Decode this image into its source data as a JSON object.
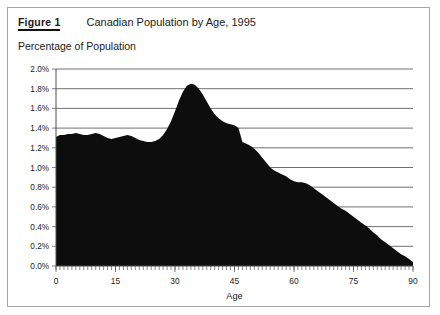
{
  "figure": {
    "label": "Figure 1",
    "title": "Canadian Population by Age, 1995",
    "subtitle": "Percentage of Population"
  },
  "chart_data": {
    "type": "area",
    "title": "Canadian Population by Age, 1995",
    "subtitle": "Percentage of Population",
    "xlabel": "Age",
    "ylabel": "Percentage of Population",
    "xlim": [
      0,
      90
    ],
    "ylim": [
      0,
      2.0
    ],
    "grid": true,
    "legend": "none",
    "fill_color": "#0d0d0d",
    "x_ticks": [
      0,
      15,
      30,
      45,
      60,
      75,
      90
    ],
    "x_tick_labels": [
      "0",
      "15",
      "30",
      "45",
      "60",
      "75",
      "90"
    ],
    "x_minor_tick_step": 1,
    "y_ticks": [
      0.0,
      0.2,
      0.4,
      0.6,
      0.8,
      1.0,
      1.2,
      1.4,
      1.6,
      1.8,
      2.0
    ],
    "y_tick_labels": [
      "0.0%",
      "0.2%",
      "0.4%",
      "0.6%",
      "0.8%",
      "1.0%",
      "1.2%",
      "1.4%",
      "1.6%",
      "1.8%",
      "2.0%"
    ],
    "x": [
      0,
      1,
      2,
      3,
      4,
      5,
      6,
      7,
      8,
      9,
      10,
      11,
      12,
      13,
      14,
      15,
      16,
      17,
      18,
      19,
      20,
      21,
      22,
      23,
      24,
      25,
      26,
      27,
      28,
      29,
      30,
      31,
      32,
      33,
      34,
      35,
      36,
      37,
      38,
      39,
      40,
      41,
      42,
      43,
      44,
      45,
      46,
      47,
      48,
      49,
      50,
      51,
      52,
      53,
      54,
      55,
      56,
      57,
      58,
      59,
      60,
      61,
      62,
      63,
      64,
      65,
      66,
      67,
      68,
      69,
      70,
      71,
      72,
      73,
      74,
      75,
      76,
      77,
      78,
      79,
      80,
      81,
      82,
      83,
      84,
      85,
      86,
      87,
      88,
      89,
      90
    ],
    "values": [
      1.31,
      1.33,
      1.33,
      1.34,
      1.34,
      1.35,
      1.34,
      1.33,
      1.33,
      1.34,
      1.35,
      1.34,
      1.32,
      1.3,
      1.29,
      1.3,
      1.31,
      1.32,
      1.33,
      1.32,
      1.3,
      1.28,
      1.27,
      1.26,
      1.26,
      1.27,
      1.29,
      1.33,
      1.39,
      1.47,
      1.57,
      1.68,
      1.77,
      1.83,
      1.85,
      1.84,
      1.8,
      1.74,
      1.67,
      1.6,
      1.54,
      1.5,
      1.47,
      1.45,
      1.44,
      1.43,
      1.4,
      1.26,
      1.24,
      1.22,
      1.19,
      1.15,
      1.1,
      1.05,
      1.0,
      0.97,
      0.95,
      0.93,
      0.91,
      0.88,
      0.86,
      0.85,
      0.85,
      0.84,
      0.82,
      0.79,
      0.76,
      0.73,
      0.7,
      0.67,
      0.64,
      0.61,
      0.58,
      0.56,
      0.53,
      0.5,
      0.47,
      0.44,
      0.41,
      0.38,
      0.34,
      0.31,
      0.27,
      0.24,
      0.21,
      0.18,
      0.15,
      0.12,
      0.1,
      0.07,
      0.04
    ],
    "series": [
      {
        "name": "Percentage of Population",
        "values": [
          1.31,
          1.33,
          1.33,
          1.34,
          1.34,
          1.35,
          1.34,
          1.33,
          1.33,
          1.34,
          1.35,
          1.34,
          1.32,
          1.3,
          1.29,
          1.3,
          1.31,
          1.32,
          1.33,
          1.32,
          1.3,
          1.28,
          1.27,
          1.26,
          1.26,
          1.27,
          1.29,
          1.33,
          1.39,
          1.47,
          1.57,
          1.68,
          1.77,
          1.83,
          1.85,
          1.84,
          1.8,
          1.74,
          1.67,
          1.6,
          1.54,
          1.5,
          1.47,
          1.45,
          1.44,
          1.43,
          1.4,
          1.26,
          1.24,
          1.22,
          1.19,
          1.15,
          1.1,
          1.05,
          1.0,
          0.97,
          0.95,
          0.93,
          0.91,
          0.88,
          0.86,
          0.85,
          0.85,
          0.84,
          0.82,
          0.79,
          0.76,
          0.73,
          0.7,
          0.67,
          0.64,
          0.61,
          0.58,
          0.56,
          0.53,
          0.5,
          0.47,
          0.44,
          0.41,
          0.38,
          0.34,
          0.31,
          0.27,
          0.24,
          0.21,
          0.18,
          0.15,
          0.12,
          0.1,
          0.07,
          0.04
        ]
      }
    ]
  }
}
